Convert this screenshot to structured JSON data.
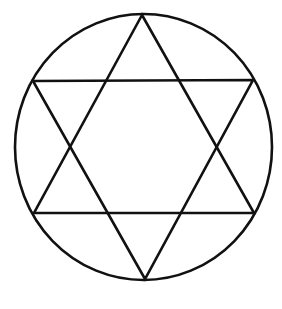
{
  "diagram": {
    "type": "hexagram-in-circle",
    "background": "#ffffff",
    "stroke": "#111111",
    "stroke_width": 2.6,
    "circle": {
      "cx": 143.5,
      "cy": 147,
      "rx": 128.5,
      "ry": 133
    },
    "triangle_up": {
      "points": [
        [
          142,
          15
        ],
        [
          34,
          213
        ],
        [
          254,
          213
        ]
      ]
    },
    "triangle_down": {
      "points": [
        [
          33,
          81
        ],
        [
          253,
          80
        ],
        [
          145,
          279
        ]
      ]
    }
  }
}
